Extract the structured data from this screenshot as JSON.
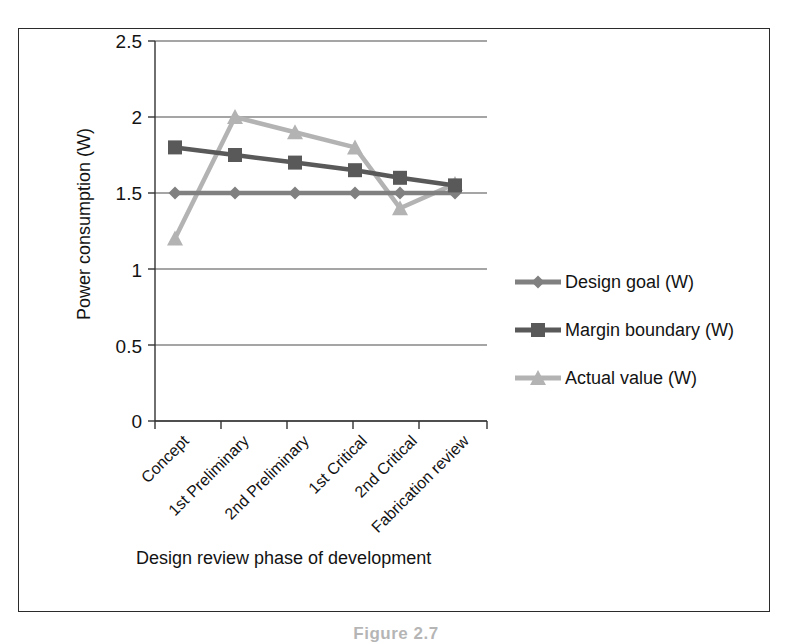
{
  "chart_data": {
    "type": "line",
    "title": "",
    "xlabel": "Design review phase of development",
    "ylabel": "Power consumption (W)",
    "categories": [
      "Concept",
      "1st Preliminary",
      "2nd Preliminary",
      "1st Critical",
      "2nd Critical",
      "Fabrication review"
    ],
    "ylim": [
      0,
      2.5
    ],
    "yticks": [
      "0",
      "0.5",
      "1",
      "1.5",
      "2",
      "2.5"
    ],
    "ytick_values": [
      0,
      0.5,
      1,
      1.5,
      2,
      2.5
    ],
    "grid": "horizontal",
    "legend_position": "right",
    "series": [
      {
        "name": "Design goal (W)",
        "color": "#808080",
        "marker": "diamond",
        "values": [
          1.5,
          1.5,
          1.5,
          1.5,
          1.5,
          1.5
        ]
      },
      {
        "name": "Margin boundary (W)",
        "color": "#595959",
        "marker": "square",
        "values": [
          1.8,
          1.75,
          1.7,
          1.65,
          1.6,
          1.55
        ]
      },
      {
        "name": "Actual value (W)",
        "color": "#b3b3b3",
        "marker": "triangle",
        "values": [
          1.2,
          2.0,
          1.9,
          1.8,
          1.4,
          1.56
        ]
      }
    ]
  },
  "figure": {
    "caption": "Figure 2.7"
  },
  "colors": {
    "frame": "#2b2b2b",
    "axis": "#333333",
    "gridline": "#4d4d4d",
    "design_goal": "#808080",
    "margin_boundary": "#595959",
    "actual_value": "#b3b3b3"
  }
}
